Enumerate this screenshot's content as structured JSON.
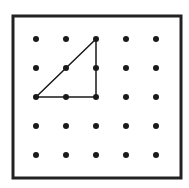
{
  "diagram": {
    "type": "geoboard",
    "grid": {
      "rows": 5,
      "cols": 5
    },
    "frame": {
      "x": 13,
      "y": 16,
      "width": 168,
      "height": 162,
      "stroke": "#222222",
      "stroke_width": 3
    },
    "dot_origin": {
      "x": 36,
      "y": 39
    },
    "dot_spacing": {
      "x": 30,
      "y": 29
    },
    "dot_radius": 3,
    "dot_color": "#1a1a1a",
    "shape": {
      "name": "right triangle",
      "vertices_grid": [
        [
          0,
          2
        ],
        [
          2,
          0
        ],
        [
          2,
          2
        ]
      ],
      "stroke": "#1a1a1a",
      "stroke_width": 1.5
    }
  }
}
